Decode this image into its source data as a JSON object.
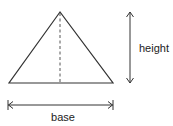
{
  "diagram": {
    "shape": "triangle",
    "labels": {
      "height": "height",
      "base": "base"
    },
    "colors": {
      "stroke": "#333333",
      "text": "#222222",
      "background": "#ffffff"
    },
    "geometry": {
      "apex": [
        60,
        12
      ],
      "base_left": [
        9,
        83
      ],
      "base_right": [
        113,
        83
      ],
      "altitude": "dashed vertical line from apex to base midpoint",
      "height_arrow": {
        "x": 130,
        "y1": 12,
        "y2": 83
      },
      "base_arrow": {
        "y": 105,
        "x1": 8,
        "x2": 113
      }
    }
  }
}
